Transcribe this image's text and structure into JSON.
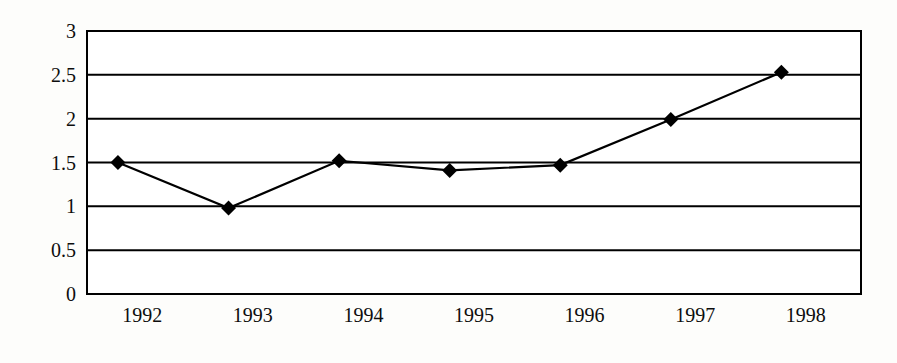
{
  "chart_data": {
    "type": "line",
    "title": "",
    "subtitle": "",
    "xlabel": "",
    "ylabel": "",
    "categories": [
      "1992",
      "1993",
      "1994",
      "1995",
      "1996",
      "1997",
      "1998"
    ],
    "values": [
      1.5,
      0.98,
      1.52,
      1.41,
      1.47,
      1.99,
      2.53
    ],
    "series": [
      {
        "name": "",
        "values": [
          1.5,
          0.98,
          1.52,
          1.41,
          1.47,
          1.99,
          2.53
        ]
      }
    ],
    "ylim": [
      0,
      3
    ],
    "ytick_labels": [
      "0",
      "0.5",
      "1",
      "1.5",
      "2",
      "2.5",
      "3"
    ],
    "ytick_values": [
      0,
      0.5,
      1,
      1.5,
      2,
      2.5,
      3
    ],
    "xtick_labels": [
      "1992",
      "1993",
      "1994",
      "1995",
      "1996",
      "1997",
      "1998"
    ],
    "grid": "horizontal",
    "legend": "none",
    "marker": "diamond",
    "line_color": "#000000",
    "marker_color": "#000000",
    "grid_color": "#000000",
    "plot_background": "#ffffff",
    "figure_background": "#fdfdfb",
    "annotations": []
  },
  "axes": {
    "plot_left": 87,
    "plot_right": 861,
    "plot_top": 31,
    "plot_bottom": 294
  }
}
